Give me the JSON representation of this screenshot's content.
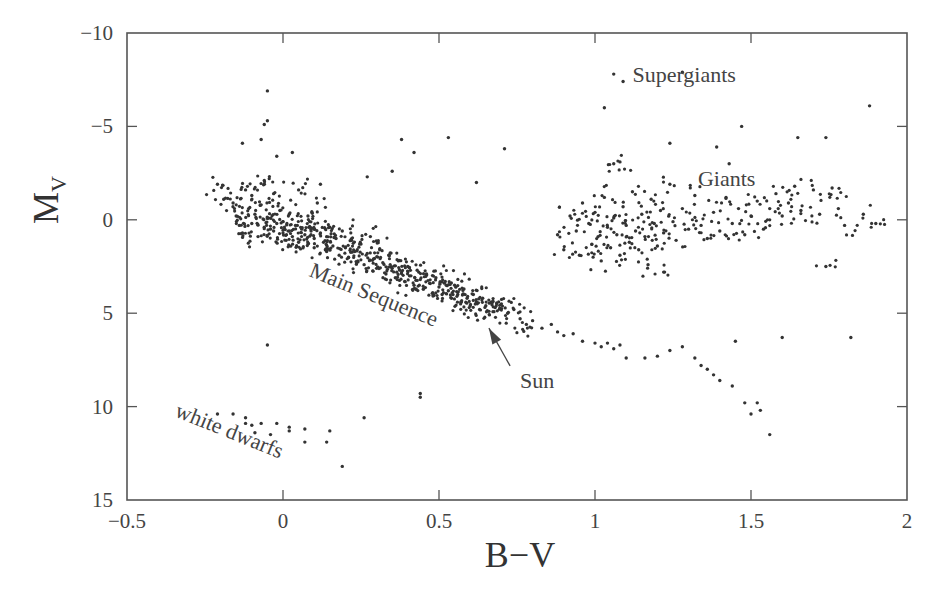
{
  "chart_data": {
    "type": "scatter",
    "title": "",
    "xlabel": "B−V",
    "ylabel": "M",
    "ylabel_subscript": "V",
    "xlim": [
      -0.5,
      2
    ],
    "ylim": [
      15,
      -10
    ],
    "y_inverted": true,
    "grid": false,
    "legend": null,
    "x_ticks": [
      -0.5,
      0,
      0.5,
      1,
      1.5,
      2
    ],
    "x_tick_labels": [
      "−0.5",
      "0",
      "0.5",
      "1",
      "1.5",
      "2"
    ],
    "y_ticks": [
      -10,
      -5,
      0,
      5,
      10,
      15
    ],
    "y_tick_labels": [
      "−10",
      "−5",
      "0",
      "5",
      "10",
      "15"
    ],
    "point_color": "#333333",
    "annotations": [
      {
        "text": "Supergiants",
        "x": 1.12,
        "y": -7.4,
        "rotation": 0
      },
      {
        "text": "Giants",
        "x": 1.33,
        "y": -1.8,
        "rotation": 0
      },
      {
        "text": "Main Sequence",
        "x": 0.08,
        "y": 3.0,
        "rotation": 22
      },
      {
        "text": "white dwarfs",
        "x": -0.35,
        "y": 10.5,
        "rotation": 22
      },
      {
        "text": "Sun",
        "x": 0.76,
        "y": 9.0,
        "rotation": 0,
        "arrow_to": {
          "x": 0.66,
          "y": 5.8
        }
      }
    ],
    "series": [
      {
        "name": "Main Sequence",
        "points": [
          [
            -0.21,
            -1.9
          ],
          [
            -0.19,
            -1.1
          ],
          [
            -0.16,
            -0.9
          ],
          [
            -0.15,
            -0.2
          ],
          [
            -0.14,
            0.3
          ],
          [
            -0.13,
            0.7
          ],
          [
            -0.12,
            -1.6
          ],
          [
            -0.11,
            -0.6
          ],
          [
            -0.1,
            -1.3
          ],
          [
            -0.1,
            0.2
          ],
          [
            -0.09,
            -0.3
          ],
          [
            -0.08,
            0.9
          ],
          [
            -0.07,
            -0.8
          ],
          [
            -0.06,
            -2.1
          ],
          [
            -0.06,
            0.4
          ],
          [
            -0.05,
            -0.1
          ],
          [
            -0.04,
            0.5
          ],
          [
            -0.03,
            -1.4
          ],
          [
            -0.03,
            0.6
          ],
          [
            -0.02,
            0.2
          ],
          [
            -0.01,
            -0.5
          ],
          [
            0.0,
            0.7
          ],
          [
            0.0,
            0.1
          ],
          [
            0.01,
            1.1
          ],
          [
            0.02,
            -0.3
          ],
          [
            0.02,
            0.6
          ],
          [
            0.03,
            0.9
          ],
          [
            0.04,
            0.3
          ],
          [
            0.05,
            1.2
          ],
          [
            0.05,
            -1.6
          ],
          [
            0.06,
            0.5
          ],
          [
            0.07,
            0.8
          ],
          [
            0.08,
            1.3
          ],
          [
            0.08,
            -0.2
          ],
          [
            0.09,
            0.6
          ],
          [
            0.1,
            1.0
          ],
          [
            0.1,
            1.5
          ],
          [
            0.11,
            -0.9
          ],
          [
            0.12,
            0.7
          ],
          [
            0.13,
            1.2
          ],
          [
            0.14,
            1.7
          ],
          [
            0.15,
            0.4
          ],
          [
            0.16,
            1.4
          ],
          [
            0.17,
            1.0
          ],
          [
            0.18,
            1.9
          ],
          [
            0.19,
            0.6
          ],
          [
            0.2,
            1.5
          ],
          [
            0.21,
            2.0
          ],
          [
            0.22,
            1.1
          ],
          [
            0.23,
            1.7
          ],
          [
            0.24,
            2.2
          ],
          [
            0.25,
            1.3
          ],
          [
            0.26,
            2.4
          ],
          [
            0.27,
            1.8
          ],
          [
            0.28,
            0.9
          ],
          [
            0.29,
            2.1
          ],
          [
            0.3,
            2.6
          ],
          [
            0.31,
            1.6
          ],
          [
            0.32,
            2.3
          ],
          [
            0.33,
            2.9
          ],
          [
            0.34,
            1.9
          ],
          [
            0.35,
            2.6
          ],
          [
            0.36,
            3.1
          ],
          [
            0.37,
            2.2
          ],
          [
            0.38,
            2.8
          ],
          [
            0.39,
            3.3
          ],
          [
            0.4,
            2.5
          ],
          [
            0.41,
            3.0
          ],
          [
            0.42,
            3.5
          ],
          [
            0.43,
            2.7
          ],
          [
            0.44,
            3.2
          ],
          [
            0.45,
            3.7
          ],
          [
            0.46,
            2.9
          ],
          [
            0.47,
            3.4
          ],
          [
            0.48,
            3.9
          ],
          [
            0.49,
            3.1
          ],
          [
            0.5,
            3.6
          ],
          [
            0.51,
            4.0
          ],
          [
            0.52,
            3.3
          ],
          [
            0.53,
            3.8
          ],
          [
            0.54,
            4.2
          ],
          [
            0.55,
            3.5
          ],
          [
            0.56,
            4.0
          ],
          [
            0.57,
            4.4
          ],
          [
            0.58,
            3.7
          ],
          [
            0.59,
            4.2
          ],
          [
            0.6,
            4.6
          ],
          [
            0.61,
            4.0
          ],
          [
            0.62,
            4.4
          ],
          [
            0.63,
            4.8
          ],
          [
            0.64,
            4.2
          ],
          [
            0.65,
            4.6
          ],
          [
            0.66,
            4.9
          ],
          [
            0.67,
            4.4
          ],
          [
            0.68,
            4.7
          ],
          [
            0.7,
            4.5
          ],
          [
            0.72,
            5.0
          ],
          [
            0.74,
            4.8
          ],
          [
            0.76,
            5.3
          ],
          [
            0.78,
            5.6
          ]
        ]
      },
      {
        "name": "Lower Main Sequence (K/M dwarfs)",
        "points": [
          [
            0.8,
            5.4
          ],
          [
            0.83,
            5.8
          ],
          [
            0.86,
            5.6
          ],
          [
            0.88,
            6.0
          ],
          [
            0.9,
            6.2
          ],
          [
            0.93,
            6.1
          ],
          [
            0.96,
            6.5
          ],
          [
            1.0,
            6.6
          ],
          [
            1.02,
            6.8
          ],
          [
            1.04,
            6.6
          ],
          [
            1.06,
            6.9
          ],
          [
            1.08,
            6.7
          ],
          [
            1.1,
            7.4
          ],
          [
            1.16,
            7.4
          ],
          [
            1.2,
            7.3
          ],
          [
            1.24,
            7.0
          ],
          [
            1.28,
            6.8
          ],
          [
            1.32,
            7.4
          ],
          [
            1.34,
            7.8
          ],
          [
            1.36,
            8.0
          ],
          [
            1.38,
            8.3
          ],
          [
            1.4,
            8.6
          ],
          [
            1.44,
            8.9
          ],
          [
            1.48,
            9.8
          ],
          [
            1.52,
            9.8
          ],
          [
            1.53,
            10.2
          ],
          [
            1.5,
            10.4
          ],
          [
            1.56,
            11.5
          ],
          [
            1.45,
            6.5
          ],
          [
            1.6,
            6.3
          ],
          [
            1.82,
            6.3
          ]
        ]
      },
      {
        "name": "Giants",
        "points": [
          [
            0.88,
            0.8
          ],
          [
            0.9,
            1.6
          ],
          [
            0.92,
            -0.2
          ],
          [
            0.94,
            0.6
          ],
          [
            0.95,
            1.9
          ],
          [
            0.96,
            -0.9
          ],
          [
            0.98,
            0.2
          ],
          [
            0.99,
            1.3
          ],
          [
            1.0,
            -0.4
          ],
          [
            1.01,
            0.9
          ],
          [
            1.02,
            2.2
          ],
          [
            1.03,
            -1.2
          ],
          [
            1.04,
            0.4
          ],
          [
            1.05,
            1.5
          ],
          [
            1.06,
            -0.1
          ],
          [
            1.07,
            0.8
          ],
          [
            1.08,
            1.9
          ],
          [
            1.09,
            -0.7
          ],
          [
            1.1,
            0.3
          ],
          [
            1.11,
            1.2
          ],
          [
            1.12,
            -1.5
          ],
          [
            1.13,
            0.6
          ],
          [
            1.14,
            1.6
          ],
          [
            1.15,
            -0.3
          ],
          [
            1.16,
            0.9
          ],
          [
            1.17,
            2.4
          ],
          [
            1.18,
            -1.1
          ],
          [
            1.19,
            0.2
          ],
          [
            1.2,
            1.4
          ],
          [
            1.21,
            -0.5
          ],
          [
            1.22,
            0.7
          ],
          [
            1.24,
            -1.9
          ],
          [
            1.25,
            0.1
          ],
          [
            1.26,
            1.1
          ],
          [
            1.28,
            -0.6
          ],
          [
            1.3,
            0.5
          ],
          [
            1.32,
            -1.3
          ],
          [
            1.34,
            0.3
          ],
          [
            1.36,
            1.0
          ],
          [
            1.38,
            -0.4
          ],
          [
            1.4,
            0.6
          ],
          [
            1.42,
            -1.2
          ],
          [
            1.44,
            0.2
          ],
          [
            1.46,
            -0.6
          ],
          [
            1.48,
            0.8
          ],
          [
            1.5,
            -0.2
          ],
          [
            1.52,
            -1.0
          ],
          [
            1.54,
            0.5
          ],
          [
            1.56,
            -0.6
          ],
          [
            1.58,
            -1.4
          ],
          [
            1.6,
            -0.2
          ],
          [
            1.62,
            -0.9
          ],
          [
            1.64,
            -1.8
          ],
          [
            1.66,
            -0.5
          ],
          [
            1.7,
            -1.6
          ],
          [
            1.72,
            -0.3
          ],
          [
            1.76,
            -1.7
          ],
          [
            1.8,
            0.3
          ],
          [
            1.86,
            -0.3
          ],
          [
            1.9,
            0.2
          ],
          [
            1.74,
            2.5
          ],
          [
            1.78,
            -0.6
          ],
          [
            1.22,
            2.8
          ],
          [
            1.06,
            -3.0
          ],
          [
            1.08,
            -3.1
          ]
        ]
      },
      {
        "name": "Supergiants / bright outliers",
        "points": [
          [
            -0.05,
            -6.9
          ],
          [
            -0.05,
            -5.3
          ],
          [
            -0.06,
            -5.1
          ],
          [
            -0.07,
            -4.3
          ],
          [
            -0.13,
            -4.1
          ],
          [
            -0.02,
            -3.4
          ],
          [
            0.03,
            -3.6
          ],
          [
            0.12,
            -1.9
          ],
          [
            0.27,
            -2.3
          ],
          [
            0.35,
            -2.6
          ],
          [
            0.38,
            -4.3
          ],
          [
            0.53,
            -4.4
          ],
          [
            0.42,
            -3.6
          ],
          [
            0.71,
            -3.8
          ],
          [
            0.62,
            -2.0
          ],
          [
            1.03,
            -6.0
          ],
          [
            1.06,
            -7.8
          ],
          [
            1.09,
            -7.4
          ],
          [
            1.28,
            -7.9
          ],
          [
            1.47,
            -5.0
          ],
          [
            1.65,
            -4.4
          ],
          [
            1.74,
            -4.4
          ],
          [
            1.88,
            -6.1
          ],
          [
            1.24,
            -4.1
          ],
          [
            1.43,
            -3.0
          ],
          [
            1.39,
            -3.9
          ]
        ]
      },
      {
        "name": "White Dwarfs",
        "points": [
          [
            -0.21,
            10.4
          ],
          [
            -0.16,
            10.4
          ],
          [
            -0.12,
            10.6
          ],
          [
            -0.12,
            10.9
          ],
          [
            -0.1,
            11.0
          ],
          [
            -0.09,
            11.4
          ],
          [
            -0.07,
            10.9
          ],
          [
            -0.04,
            11.5
          ],
          [
            -0.02,
            10.9
          ],
          [
            0.02,
            11.1
          ],
          [
            0.02,
            11.3
          ],
          [
            0.07,
            11.2
          ],
          [
            0.07,
            11.9
          ],
          [
            0.15,
            11.3
          ],
          [
            0.14,
            11.9
          ],
          [
            0.19,
            13.2
          ],
          [
            0.26,
            10.6
          ],
          [
            0.44,
            9.5
          ],
          [
            0.44,
            9.3
          ],
          [
            -0.05,
            6.7
          ]
        ]
      }
    ]
  }
}
